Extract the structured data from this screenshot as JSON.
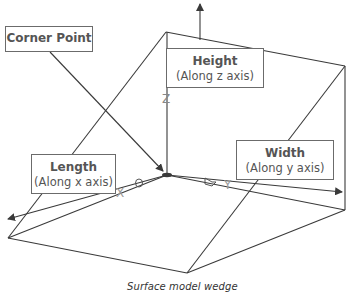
{
  "figure": {
    "caption": "Surface model wedge",
    "callouts": {
      "corner_point": {
        "title": "Corner Point"
      },
      "height": {
        "title": "Height",
        "sub": "(Along z axis)"
      },
      "length": {
        "title": "Length",
        "sub": "(Along x axis)"
      },
      "width": {
        "title": "Width",
        "sub": "(Along y axis)"
      }
    },
    "axes": {
      "x": {
        "label": "X"
      },
      "y": {
        "label": "Y"
      },
      "z": {
        "label": "Z"
      }
    },
    "colors": {
      "line": "#3a3a3a",
      "box_border": "#6b6b6b",
      "text": "#555555",
      "axis_letter": "#8a8a8a"
    }
  }
}
